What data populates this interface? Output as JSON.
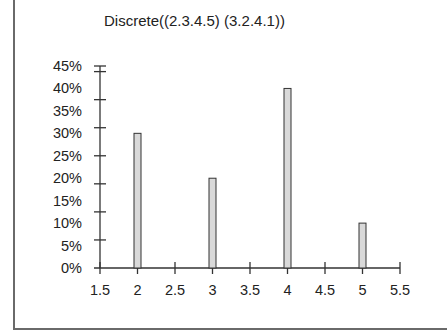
{
  "chart_data": {
    "type": "bar",
    "title": "Discrete((2.3.4.5) (3.2.4.1))",
    "xlabel": "",
    "ylabel": "",
    "categories": [
      2,
      3,
      4,
      5
    ],
    "values": [
      0.3,
      0.2,
      0.4,
      0.1
    ],
    "values_pct": [
      "30%",
      "20%",
      "40%",
      "10%"
    ],
    "xlim": [
      1.5,
      5.5
    ],
    "ylim": [
      0,
      0.45
    ],
    "x_ticks": [
      "1.5",
      "2",
      "2.5",
      "3",
      "3.5",
      "4",
      "4.5",
      "5",
      "5.5"
    ],
    "y_ticks": [
      "0%",
      "5%",
      "10%",
      "15%",
      "20%",
      "25%",
      "30%",
      "35%",
      "40%",
      "45%"
    ],
    "grid": false,
    "legend": null,
    "bar_fill": "#d9d9d9",
    "bar_stroke": "#333333"
  }
}
